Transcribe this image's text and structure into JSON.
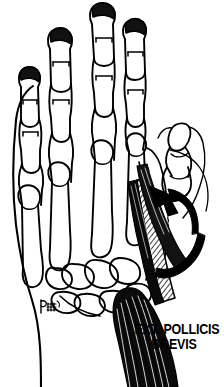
{
  "figure": {
    "title": "EXT. POLLICIS BREVIS",
    "view": "dorsal view of right hand skeleton",
    "background_color": "#FFFFFF",
    "ink_color": "#000000",
    "label": {
      "line1": "EXT. POLLICIS",
      "line2": "BREVIS"
    },
    "signature": {
      "present": true,
      "mark": "artist-monogram"
    },
    "annotations": {
      "motion_arrow": {
        "name": "thumb-extension-arrow",
        "description": "curved solid black arrow indicating direction of thumb extension",
        "direction": "up-left"
      }
    },
    "structures": [
      {
        "name": "distal-phalanx-index",
        "kind": "bone"
      },
      {
        "name": "middle-phalanx-index",
        "kind": "bone"
      },
      {
        "name": "proximal-phalanx-index",
        "kind": "bone"
      },
      {
        "name": "distal-phalanx-middle",
        "kind": "bone"
      },
      {
        "name": "middle-phalanx-middle",
        "kind": "bone"
      },
      {
        "name": "proximal-phalanx-middle",
        "kind": "bone"
      },
      {
        "name": "distal-phalanx-ring",
        "kind": "bone"
      },
      {
        "name": "middle-phalanx-ring",
        "kind": "bone"
      },
      {
        "name": "proximal-phalanx-ring",
        "kind": "bone"
      },
      {
        "name": "distal-phalanx-little",
        "kind": "bone"
      },
      {
        "name": "middle-phalanx-little",
        "kind": "bone"
      },
      {
        "name": "proximal-phalanx-little",
        "kind": "bone"
      },
      {
        "name": "metacarpal-1",
        "kind": "bone"
      },
      {
        "name": "metacarpal-2",
        "kind": "bone"
      },
      {
        "name": "metacarpal-3",
        "kind": "bone"
      },
      {
        "name": "metacarpal-4",
        "kind": "bone"
      },
      {
        "name": "metacarpal-5",
        "kind": "bone"
      },
      {
        "name": "carpal-bones",
        "kind": "bone-group"
      },
      {
        "name": "thumb-distal-phalanx",
        "kind": "bone"
      },
      {
        "name": "thumb-proximal-phalanx",
        "kind": "bone"
      },
      {
        "name": "extensor-pollicis-brevis-muscle-belly",
        "kind": "muscle"
      },
      {
        "name": "extensor-pollicis-brevis-tendon",
        "kind": "tendon"
      },
      {
        "name": "hand-skin-outline",
        "kind": "contour"
      }
    ]
  }
}
